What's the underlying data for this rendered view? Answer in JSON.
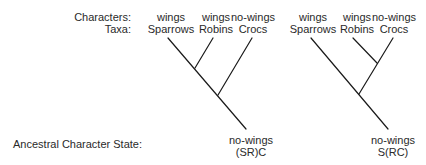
{
  "row_labels": {
    "characters": "Characters:",
    "taxa": "Taxa:",
    "ancestral": "Ancestral Character State:"
  },
  "trees": [
    {
      "leaves": [
        {
          "character": "wings",
          "taxon": "Sparrows"
        },
        {
          "character": "wings",
          "taxon": "Robins"
        },
        {
          "character": "no-wings",
          "taxon": "Crocs"
        }
      ],
      "root_state": "no-wings",
      "topology": "(SR)C"
    },
    {
      "leaves": [
        {
          "character": "wings",
          "taxon": "Sparrows"
        },
        {
          "character": "wings",
          "taxon": "Robins"
        },
        {
          "character": "no-wings",
          "taxon": "Crocs"
        }
      ],
      "root_state": "no-wings",
      "topology": "S(RC)"
    }
  ],
  "colors": {
    "line": "#1a1a1a",
    "text": "#2a2a2a",
    "background": "#ffffff"
  }
}
